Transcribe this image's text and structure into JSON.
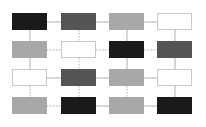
{
  "diagram": {
    "type": "grid-graph",
    "rows": 4,
    "cols": 4,
    "col_x": [
      12,
      61,
      109,
      157
    ],
    "row_y": [
      13,
      41,
      69,
      97
    ],
    "node_w": 35,
    "node_h": 17,
    "colors": {
      "black": "#1a1a1a",
      "dark": "#555555",
      "gray": "#a8a8a8",
      "white": "#ffffff"
    },
    "nodes": [
      [
        "black",
        "dark",
        "gray",
        "white"
      ],
      [
        "gray",
        "white",
        "black",
        "dark"
      ],
      [
        "white",
        "dark",
        "gray",
        "white"
      ],
      [
        "gray",
        "black",
        "gray",
        "black"
      ]
    ],
    "h_edges": [
      [
        "solid",
        "solid",
        "solid"
      ],
      [
        "dashed",
        "dashed",
        "dashed"
      ],
      [
        "solid",
        "solid",
        "solid"
      ],
      [
        "dashed",
        "solid",
        "solid"
      ]
    ],
    "v_edges": [
      [
        "solid",
        "dashed",
        "solid",
        "solid"
      ],
      [
        "solid",
        "dashed",
        "solid",
        "solid"
      ],
      [
        "dashed",
        "dashed",
        "dashed",
        "solid"
      ]
    ],
    "edge_color": "#b0b0b0"
  }
}
